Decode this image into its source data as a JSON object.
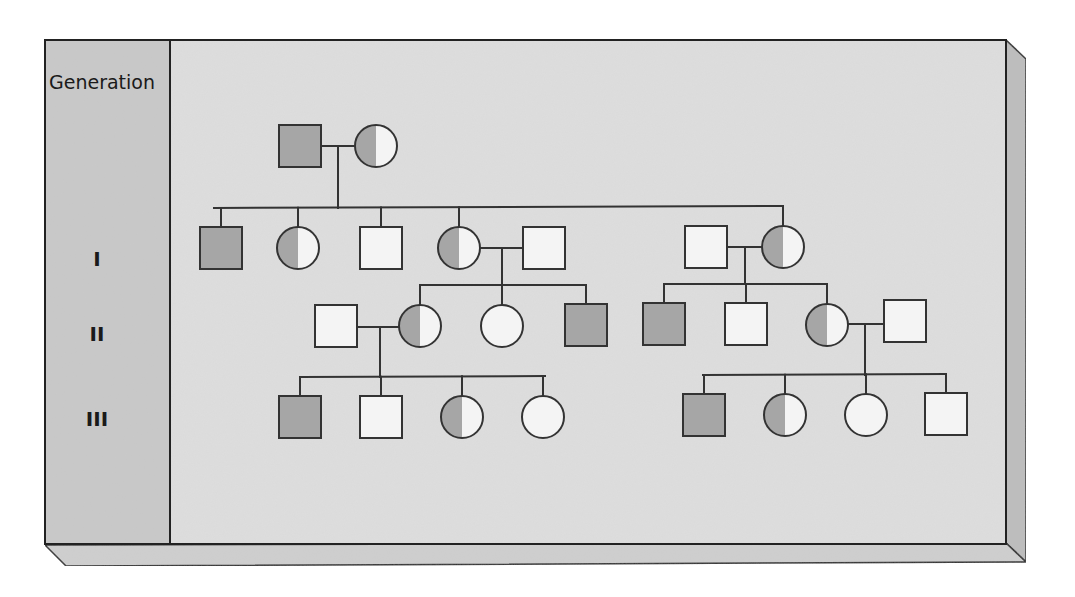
{
  "diagram": {
    "type": "pedigree-chart",
    "column_header": "Generation",
    "generations": [
      {
        "label": "I",
        "y": 258
      },
      {
        "label": "II",
        "y": 333
      },
      {
        "label": "III",
        "y": 418
      }
    ],
    "colors": {
      "affected_fill": "#a6a6a6",
      "unaffected_fill": "#f4f4f4",
      "carrier_left_fill": "#a6a6a6",
      "carrier_right_fill": "#f4f4f4",
      "stroke": "#333333",
      "panel_bg": "#dcdcdc",
      "label_column_bg": "#c9c9c9",
      "side_bevel": "#bdbdbd",
      "bottom_bevel": "#cfcfcf"
    },
    "legend_meaning": {
      "square": "male",
      "circle": "female",
      "filled": "affected",
      "half-filled": "carrier",
      "empty": "unaffected"
    },
    "individuals": [
      {
        "id": "P1",
        "sex": "male",
        "status": "affected",
        "cx": 300,
        "cy": 146,
        "generation": "parental"
      },
      {
        "id": "P2",
        "sex": "female",
        "status": "carrier",
        "cx": 376,
        "cy": 146,
        "generation": "parental"
      },
      {
        "id": "I1",
        "sex": "male",
        "status": "affected",
        "cx": 221,
        "cy": 248,
        "generation": "I"
      },
      {
        "id": "I2",
        "sex": "female",
        "status": "carrier",
        "cx": 298,
        "cy": 248,
        "generation": "I"
      },
      {
        "id": "I3",
        "sex": "male",
        "status": "unaffected",
        "cx": 381,
        "cy": 248,
        "generation": "I"
      },
      {
        "id": "I4",
        "sex": "female",
        "status": "carrier",
        "cx": 459,
        "cy": 248,
        "generation": "I"
      },
      {
        "id": "I5",
        "sex": "male",
        "status": "unaffected",
        "cx": 544,
        "cy": 248,
        "generation": "I"
      },
      {
        "id": "I6",
        "sex": "male",
        "status": "unaffected",
        "cx": 706,
        "cy": 247,
        "generation": "I"
      },
      {
        "id": "I7",
        "sex": "female",
        "status": "carrier",
        "cx": 783,
        "cy": 247,
        "generation": "I"
      },
      {
        "id": "II1",
        "sex": "male",
        "status": "unaffected",
        "cx": 336,
        "cy": 326,
        "generation": "II"
      },
      {
        "id": "II2",
        "sex": "female",
        "status": "carrier",
        "cx": 420,
        "cy": 326,
        "generation": "II"
      },
      {
        "id": "II3",
        "sex": "female",
        "status": "unaffected",
        "cx": 502,
        "cy": 326,
        "generation": "II"
      },
      {
        "id": "II4",
        "sex": "male",
        "status": "affected",
        "cx": 586,
        "cy": 325,
        "generation": "II"
      },
      {
        "id": "II5",
        "sex": "male",
        "status": "affected",
        "cx": 664,
        "cy": 324,
        "generation": "II"
      },
      {
        "id": "II6",
        "sex": "male",
        "status": "unaffected",
        "cx": 746,
        "cy": 324,
        "generation": "II"
      },
      {
        "id": "II7",
        "sex": "female",
        "status": "carrier",
        "cx": 827,
        "cy": 325,
        "generation": "II"
      },
      {
        "id": "II8",
        "sex": "male",
        "status": "unaffected",
        "cx": 905,
        "cy": 321,
        "generation": "II"
      },
      {
        "id": "III1",
        "sex": "male",
        "status": "affected",
        "cx": 300,
        "cy": 417,
        "generation": "III"
      },
      {
        "id": "III2",
        "sex": "male",
        "status": "unaffected",
        "cx": 381,
        "cy": 417,
        "generation": "III"
      },
      {
        "id": "III3",
        "sex": "female",
        "status": "carrier",
        "cx": 462,
        "cy": 417,
        "generation": "III"
      },
      {
        "id": "III4",
        "sex": "female",
        "status": "unaffected",
        "cx": 543,
        "cy": 417,
        "generation": "III"
      },
      {
        "id": "III5",
        "sex": "male",
        "status": "affected",
        "cx": 704,
        "cy": 415,
        "generation": "III"
      },
      {
        "id": "III6",
        "sex": "female",
        "status": "carrier",
        "cx": 785,
        "cy": 415,
        "generation": "III"
      },
      {
        "id": "III7",
        "sex": "female",
        "status": "unaffected",
        "cx": 866,
        "cy": 415,
        "generation": "III"
      },
      {
        "id": "III8",
        "sex": "male",
        "status": "unaffected",
        "cx": 946,
        "cy": 414,
        "generation": "III"
      }
    ],
    "unions": [
      {
        "partners": [
          "P1",
          "P2"
        ],
        "line": [
          [
            322,
            146
          ],
          [
            354,
            146
          ]
        ],
        "drop": [
          [
            338,
            146
          ],
          [
            338,
            208
          ]
        ],
        "sibship": {
          "bar": [
            [
              214,
              208
            ],
            [
              783,
              206
            ]
          ],
          "children": [
            "I1",
            "I2",
            "I3",
            "I4",
            "I7"
          ]
        }
      },
      {
        "partners": [
          "I4",
          "I5"
        ],
        "line": [
          [
            481,
            248
          ],
          [
            522,
            248
          ]
        ],
        "drop": [
          [
            502,
            248
          ],
          [
            502,
            285
          ]
        ],
        "sibship": {
          "bar": [
            [
              421,
              285
            ],
            [
              586,
              285
            ]
          ],
          "children": [
            "II2",
            "II3",
            "II4"
          ]
        }
      },
      {
        "partners": [
          "I6",
          "I7"
        ],
        "line": [
          [
            728,
            247
          ],
          [
            761,
            247
          ]
        ],
        "drop": [
          [
            745,
            247
          ],
          [
            745,
            284
          ]
        ],
        "sibship": {
          "bar": [
            [
              665,
              284
            ],
            [
              827,
              284
            ]
          ],
          "children": [
            "II5",
            "II6",
            "II7"
          ]
        }
      },
      {
        "partners": [
          "II1",
          "II2"
        ],
        "line": [
          [
            358,
            327
          ],
          [
            398,
            327
          ]
        ],
        "drop": [
          [
            380,
            327
          ],
          [
            380,
            377
          ]
        ],
        "sibship": {
          "bar": [
            [
              300,
              377
            ],
            [
              545,
              376
            ]
          ],
          "children": [
            "III1",
            "III2",
            "III3",
            "III4"
          ]
        }
      },
      {
        "partners": [
          "II7",
          "II8"
        ],
        "line": [
          [
            849,
            324
          ],
          [
            883,
            324
          ]
        ],
        "drop": [
          [
            865,
            324
          ],
          [
            865,
            375
          ]
        ],
        "sibship": {
          "bar": [
            [
              703,
              375
            ],
            [
              946,
              374
            ]
          ],
          "children": [
            "III5",
            "III6",
            "III7",
            "III8"
          ]
        }
      }
    ]
  }
}
